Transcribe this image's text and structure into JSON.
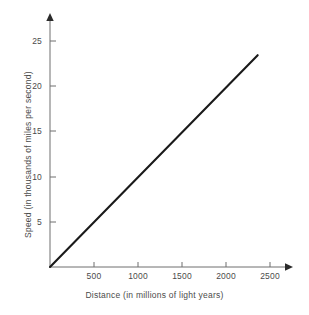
{
  "chart_data": {
    "type": "line",
    "title": "",
    "subtitle": "",
    "xlabel": "Distance (in millions of light years)",
    "ylabel": "Speed (in thousands of miles per second)",
    "xlim": [
      0,
      2700
    ],
    "ylim": [
      0,
      27
    ],
    "xticks": [
      500,
      1000,
      1500,
      2000,
      2500
    ],
    "xtick_labels": [
      "500",
      "1000",
      "1500",
      "2000",
      "2500"
    ],
    "yticks": [
      5,
      10,
      15,
      20,
      25
    ],
    "ytick_labels": [
      "5",
      "10",
      "15",
      "20",
      "25"
    ],
    "grid": false,
    "legend": null,
    "annotations": [],
    "series": [
      {
        "name": "speed vs distance",
        "color": "#1a1a1a",
        "x": [
          0,
          2360
        ],
        "y": [
          0,
          23.4
        ]
      }
    ],
    "colors": {
      "line": "#1a1a1a",
      "axis": "#4b4b4b",
      "text": "#4b4b4b",
      "background": "#ffffff"
    }
  },
  "geometry": {
    "origin_x": 50,
    "origin_y": 267,
    "x_axis_end": 292,
    "y_axis_end": 14,
    "px_per_500_x": 44,
    "px_per_5_y": 45.25
  }
}
